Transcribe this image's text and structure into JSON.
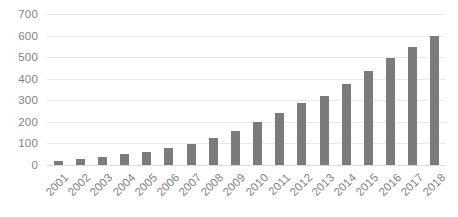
{
  "chart_data": {
    "type": "bar",
    "title": "",
    "subtitle": "",
    "xlabel": "",
    "ylabel": "",
    "categories": [
      "2001",
      "2002",
      "2003",
      "2004",
      "2005",
      "2006",
      "2007",
      "2008",
      "2009",
      "2010",
      "2011",
      "2012",
      "2013",
      "2014",
      "2015",
      "2016",
      "2017",
      "2018"
    ],
    "values": [
      20,
      27,
      38,
      50,
      62,
      77,
      97,
      123,
      160,
      200,
      240,
      287,
      322,
      375,
      438,
      495,
      547,
      598
    ],
    "series": [
      {
        "name": "",
        "values": [
          20,
          27,
          38,
          50,
          62,
          77,
          97,
          123,
          160,
          200,
          240,
          287,
          322,
          375,
          438,
          495,
          547,
          598
        ]
      }
    ],
    "ylim": [
      0,
      700
    ],
    "yticks": [
      0,
      100,
      200,
      300,
      400,
      500,
      600,
      700
    ],
    "ytick_labels": [
      "0",
      "100",
      "200",
      "300",
      "400",
      "500",
      "600",
      "700"
    ],
    "grid": true,
    "grid_axis": "y",
    "legend": false,
    "legend_position": "none",
    "bar_color": "#7b7b7b",
    "gridline_color": "#e8e8e8",
    "axis_text_color": "#7f7f7f",
    "background_color": "#ffffff",
    "xtick_rotation": -45
  }
}
